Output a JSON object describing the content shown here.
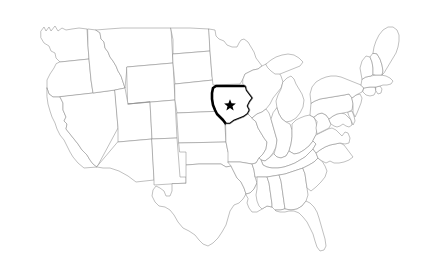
{
  "map": {
    "title": "Map of the United States",
    "region": "Contiguous United States",
    "background_color": "#ffffff",
    "border_color": "#8c8c8c",
    "highlight_color": "#000000",
    "highlighted_state": {
      "name": "Iowa",
      "abbreviation": "IA",
      "outline_color": "#000000",
      "outline_width_px": 2.6,
      "fill_color": "#ffffff"
    },
    "marker": {
      "type": "star",
      "name": "capital-star",
      "color": "#000000",
      "state": "Iowa",
      "x": 230,
      "y": 105
    },
    "labels_visible": false,
    "legend_visible": false,
    "states": [
      "Washington",
      "Oregon",
      "California",
      "Nevada",
      "Idaho",
      "Montana",
      "Wyoming",
      "Utah",
      "Arizona",
      "Colorado",
      "New Mexico",
      "North Dakota",
      "South Dakota",
      "Nebraska",
      "Kansas",
      "Oklahoma",
      "Texas",
      "Minnesota",
      "Iowa",
      "Missouri",
      "Arkansas",
      "Louisiana",
      "Wisconsin",
      "Illinois",
      "Michigan",
      "Indiana",
      "Ohio",
      "Kentucky",
      "Tennessee",
      "Mississippi",
      "Alabama",
      "Georgia",
      "Florida",
      "South Carolina",
      "North Carolina",
      "Virginia",
      "West Virginia",
      "Maryland",
      "Delaware",
      "Pennsylvania",
      "New Jersey",
      "New York",
      "Connecticut",
      "Rhode Island",
      "Massachusetts",
      "Vermont",
      "New Hampshire",
      "Maine"
    ]
  }
}
